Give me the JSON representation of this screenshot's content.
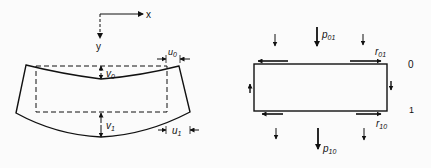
{
  "left_figure": {
    "axes": {
      "x_label": "x",
      "y_label": "y"
    },
    "labels": {
      "v0": {
        "main": "v",
        "sub": "0"
      },
      "v1": {
        "main": "v",
        "sub": "1"
      },
      "u0": {
        "main": "u",
        "sub": "0"
      },
      "u1": {
        "main": "u",
        "sub": "1"
      }
    }
  },
  "right_figure": {
    "labels": {
      "p01": {
        "main": "p",
        "sub": "01"
      },
      "p10": {
        "main": "p",
        "sub": "10"
      },
      "r01": {
        "main": "r",
        "sub": "01"
      },
      "r10": {
        "main": "r",
        "sub": "10"
      }
    },
    "side_labels": {
      "top": "0",
      "bottom": "1"
    }
  },
  "colors": {
    "ink": "#111111",
    "background": "#fbfbfb"
  }
}
